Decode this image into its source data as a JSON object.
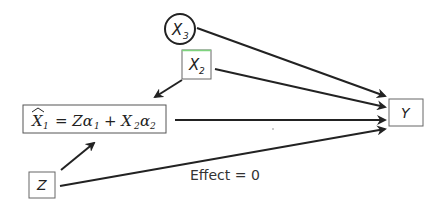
{
  "diagram": {
    "type": "causal-dag",
    "nodes": {
      "x3": {
        "label": "X",
        "sub": "3",
        "shape": "circle"
      },
      "x2": {
        "label": "X",
        "sub": "2",
        "shape": "box",
        "border_top_color": "#7ed37e"
      },
      "x1hat": {
        "label_hat": "X",
        "sub1": "1",
        "eq": "= Zα",
        "a1": "1",
        "plus": "+ X",
        "s2": "2",
        "alpha": "α",
        "a2": "2",
        "shape": "box"
      },
      "z": {
        "label": "Z",
        "shape": "box"
      },
      "y": {
        "label": "Y",
        "shape": "box"
      }
    },
    "edges": [
      {
        "from": "x3",
        "to": "y"
      },
      {
        "from": "x2",
        "to": "y"
      },
      {
        "from": "x2",
        "to": "x1hat"
      },
      {
        "from": "x1hat",
        "to": "y"
      },
      {
        "from": "z",
        "to": "x1hat"
      },
      {
        "from": "z",
        "to": "y",
        "label": "Effect = 0"
      }
    ],
    "edge_label": "Effect = 0",
    "colors": {
      "stroke": "#222222",
      "box_border": "#555555",
      "x2_top": "#7ed37e"
    }
  }
}
